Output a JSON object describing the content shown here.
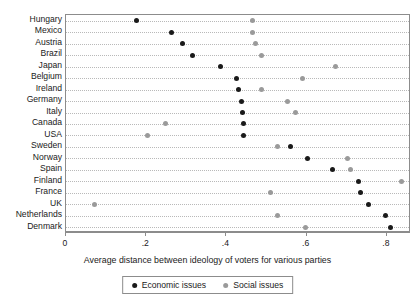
{
  "chart_data": {
    "type": "scatter",
    "title": "",
    "xlabel": "Average distance between ideology of voters for various parties",
    "ylabel": "",
    "xlim": [
      0,
      0.86
    ],
    "xticks": [
      0,
      0.2,
      0.4,
      0.6,
      0.8
    ],
    "xticklabels": [
      "0",
      ".2",
      ".4",
      ".6",
      ".8"
    ],
    "grid": true,
    "grid_style": "horizontal-dotted",
    "legend_position": "bottom-center",
    "categories": [
      "Hungary",
      "Mexico",
      "Austria",
      "Brazil",
      "Japan",
      "Belgium",
      "Ireland",
      "Germany",
      "Italy",
      "Canada",
      "USA",
      "Sweden",
      "Norway",
      "Spain",
      "Finland",
      "France",
      "UK",
      "Netherlands",
      "Denmark"
    ],
    "series": [
      {
        "name": "Economic issues",
        "color": "#1a1a1a",
        "marker": "circle",
        "values": [
          0.178,
          0.265,
          0.293,
          0.318,
          0.388,
          0.428,
          0.432,
          0.44,
          0.442,
          0.445,
          0.445,
          0.563,
          0.605,
          0.667,
          0.733,
          0.738,
          0.758,
          0.8,
          0.813
        ]
      },
      {
        "name": "Social issues",
        "color": "#9a9a9a",
        "marker": "circle",
        "values": [
          0.468,
          0.468,
          0.475,
          0.49,
          0.675,
          0.593,
          0.49,
          0.555,
          0.575,
          0.25,
          0.205,
          0.53,
          0.705,
          0.713,
          0.84,
          0.513,
          0.072,
          0.53,
          0.6
        ]
      }
    ]
  },
  "legend": {
    "items": [
      {
        "label": "Economic issues",
        "marker": "economic-dot"
      },
      {
        "label": "Social issues",
        "marker": "social-dot"
      }
    ]
  }
}
